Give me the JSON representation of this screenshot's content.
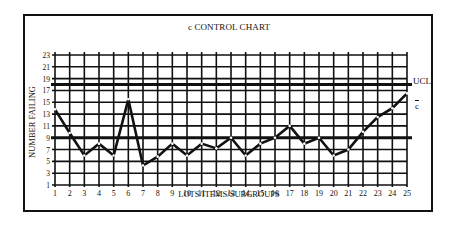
{
  "chart_data": {
    "type": "line",
    "title": "c CONTROL CHART",
    "xlabel": "LOTS/ITEMS/SUBGROUPS",
    "ylabel": "NUMBER FAILING",
    "x": [
      1,
      2,
      3,
      4,
      5,
      6,
      7,
      8,
      9,
      10,
      11,
      12,
      13,
      14,
      15,
      16,
      17,
      18,
      19,
      20,
      21,
      22,
      23,
      24,
      25
    ],
    "series": [
      {
        "name": "Number failing",
        "values": [
          13.8,
          9.8,
          6,
          8,
          6,
          15.5,
          4.3,
          5.8,
          8,
          6,
          8,
          7.2,
          9,
          6,
          8,
          9,
          11,
          8,
          9,
          6,
          7,
          10,
          12.5,
          14,
          16.5
        ]
      }
    ],
    "reference_lines": [
      {
        "name": "UCL",
        "label": "UCL",
        "value": 18
      },
      {
        "name": "center line",
        "label": "c",
        "value": 9
      }
    ],
    "y_ticks": [
      1,
      3,
      5,
      7,
      9,
      11,
      13,
      15,
      17,
      19,
      21,
      23
    ],
    "x_ticks": [
      1,
      2,
      3,
      4,
      5,
      6,
      7,
      8,
      9,
      10,
      11,
      12,
      13,
      14,
      15,
      16,
      17,
      18,
      19,
      20,
      21,
      22,
      23,
      24,
      25
    ],
    "xlim": [
      1,
      25
    ],
    "ylim": [
      1,
      23
    ],
    "grid": true,
    "legend": "none"
  },
  "labels": {
    "title": "c CONTROL CHART",
    "xlabel": "LOTS/ITEMS/SUBGROUPS",
    "ylabel": "NUMBER FAILING",
    "ucl": "UCL",
    "cbar": "c"
  }
}
